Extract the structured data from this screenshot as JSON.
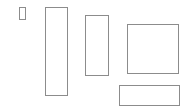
{
  "canvas": {
    "width": 194,
    "height": 110,
    "background": "#ffffff",
    "border_color": "#8c8c8c"
  },
  "boxes": [
    {
      "name": "small-box",
      "left": 19,
      "top": 7,
      "width": 7,
      "height": 13
    },
    {
      "name": "tall-left-box",
      "left": 45,
      "top": 7,
      "width": 23,
      "height": 89
    },
    {
      "name": "middle-box",
      "left": 85,
      "top": 15,
      "width": 24,
      "height": 61
    },
    {
      "name": "square-box",
      "left": 127,
      "top": 24,
      "width": 52,
      "height": 50
    },
    {
      "name": "bottom-wide-box",
      "left": 119,
      "top": 85,
      "width": 61,
      "height": 21
    }
  ]
}
